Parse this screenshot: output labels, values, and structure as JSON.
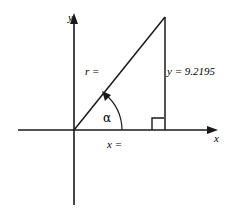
{
  "figure": {
    "type": "geometry-diagram",
    "axes": {
      "x_label": "x",
      "y_label": "y"
    },
    "labels": {
      "hypotenuse": "r =",
      "opposite_side": "y = 9.2195",
      "adjacent_side": "x =",
      "angle": "α"
    },
    "colors": {
      "stroke": "#1a1a1a",
      "background": "#ffffff",
      "text": "#000000"
    },
    "geometry": {
      "origin": [
        74,
        130
      ],
      "apex": [
        165,
        17
      ],
      "foot": [
        165,
        130
      ],
      "x_axis": [
        18,
        218
      ],
      "y_axis": [
        13,
        205
      ],
      "right_angle_marker": true,
      "angle_arc_arrow": true
    }
  }
}
